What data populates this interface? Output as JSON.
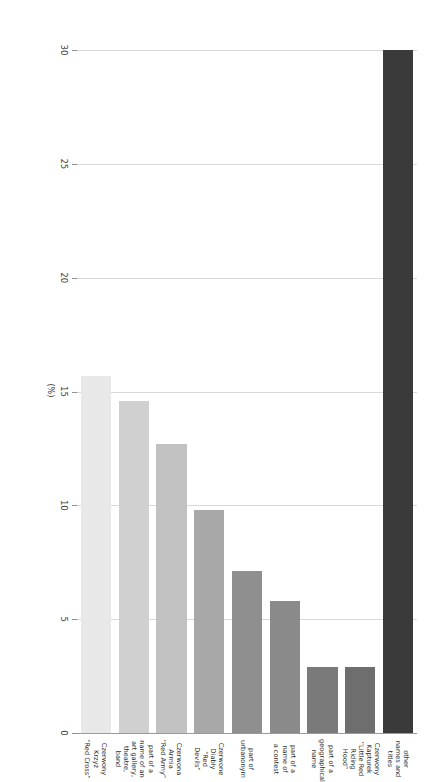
{
  "chart_data": {
    "type": "bar",
    "orientation": "horizontal",
    "title": "",
    "xlabel": "(%)",
    "ylabel": "",
    "xlim": [
      0,
      30
    ],
    "xticks": [
      0,
      5,
      10,
      15,
      20,
      25,
      30
    ],
    "xticklabels": [
      "0",
      "5",
      "10",
      "15",
      "20",
      "25",
      "30"
    ],
    "grid": true,
    "legend": "none",
    "categories": [
      "Czerwony Krzyż\n“Red Cross”",
      "part of a name of an\nart gallery, theatre,\nband",
      "Czerwona Armia\n“Red Army”",
      "Czerwone Diabły\n“Red Devils”",
      "part of urbanonym",
      "part of a name of\na contest",
      "part of a\ngeographical name",
      "Czerwony Kapturek\n“Little Red Riding\nHood”",
      "other names and\ntitles"
    ],
    "values": [
      15.7,
      14.6,
      12.7,
      9.8,
      7.1,
      5.8,
      2.9,
      2.9,
      30.0
    ],
    "bar_colors": [
      "#e8e8e8",
      "#d0d0d0",
      "#c2c2c2",
      "#a8a8a8",
      "#8f8f8f",
      "#8a8a8a",
      "#7a7a7a",
      "#6e6e6e",
      "#3a3a3a"
    ]
  }
}
